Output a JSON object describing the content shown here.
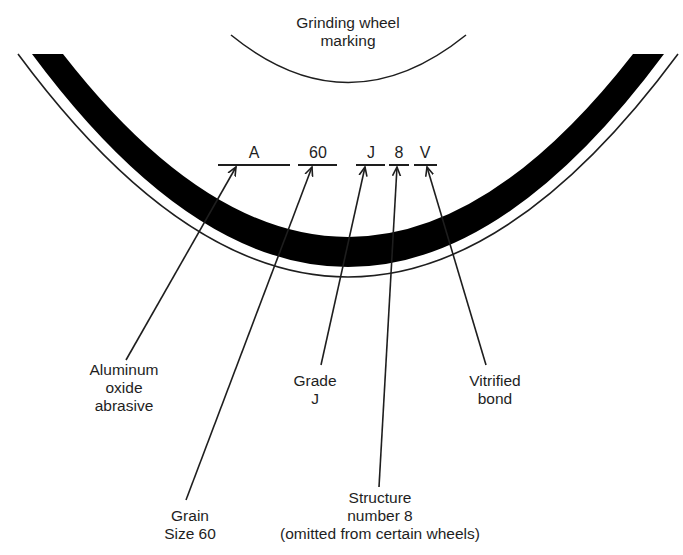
{
  "title": {
    "lines": [
      "Grinding wheel",
      "marking"
    ]
  },
  "marking": {
    "codes": [
      "A",
      "60",
      "J",
      "8",
      "V"
    ]
  },
  "labels": {
    "abrasive": [
      "Aluminum",
      "oxide",
      "abrasive"
    ],
    "grain": [
      "Grain",
      "Size 60"
    ],
    "grade": [
      "Grade",
      "J"
    ],
    "structure": [
      "Structure",
      "number 8",
      "(omitted from certain wheels)"
    ],
    "bond": [
      "Vitrified",
      "bond"
    ]
  },
  "colors": {
    "ink": "#1e1e1e",
    "band": "#000000",
    "background": "#ffffff"
  }
}
